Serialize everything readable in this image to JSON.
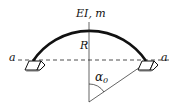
{
  "diagram": {
    "top_label": "EI, m",
    "radius_label": "R",
    "axis_label_left": "a",
    "axis_label_right": "a",
    "angle_label": "α",
    "angle_subscript": "0"
  },
  "colors": {
    "line": "#111111",
    "support_shadow": "#bbbbbb"
  }
}
